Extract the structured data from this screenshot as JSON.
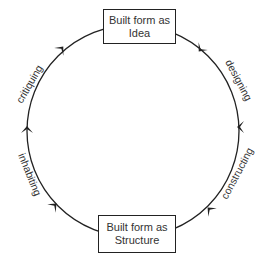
{
  "nodes": {
    "top": {
      "line1": "Built form as",
      "line2": "Idea"
    },
    "bottom": {
      "line1": "Built form as",
      "line2": "Structure"
    }
  },
  "edges": [
    {
      "label": "designing",
      "side": "right-upper",
      "direction": "clockwise"
    },
    {
      "label": "constructing",
      "side": "right-lower",
      "direction": "clockwise"
    },
    {
      "label": "inhabiting",
      "side": "left-lower",
      "direction": "clockwise"
    },
    {
      "label": "critiquing",
      "side": "left-upper",
      "direction": "clockwise"
    }
  ],
  "colors": {
    "stroke": "#222222",
    "text": "#333333",
    "background": "#ffffff"
  }
}
